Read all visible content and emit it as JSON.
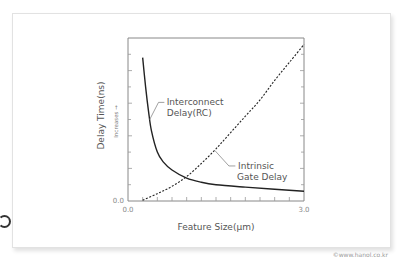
{
  "watermark": "©www.hanol.co.kr",
  "chart_data": {
    "type": "line",
    "title": "",
    "xlabel": "Feature Size(μm)",
    "ylabel": "Delay Time(ns)",
    "ylabel_secondary": "Increases →",
    "xlim": [
      0.0,
      3.0
    ],
    "ylim": [
      0,
      10
    ],
    "x_tick_labels": [
      "0.0",
      "3.0"
    ],
    "y_tick_labels": [
      "0.0"
    ],
    "x_minor_ticks": 12,
    "y_minor_ticks": 10,
    "grid": false,
    "legend": "none",
    "series": [
      {
        "name": "Interconnect Delay(RC)",
        "label_lines": [
          "Interconnect",
          "Delay(RC)"
        ],
        "style": "solid",
        "color": "#222222",
        "x": [
          0.25,
          0.3,
          0.35,
          0.4,
          0.5,
          0.6,
          0.75,
          1.0,
          1.25,
          1.5,
          2.0,
          2.5,
          3.0
        ],
        "y": [
          8.8,
          7.0,
          5.5,
          4.3,
          3.0,
          2.4,
          1.9,
          1.4,
          1.15,
          1.0,
          0.85,
          0.72,
          0.6
        ]
      },
      {
        "name": "Intrinsic Gate Delay",
        "label_lines": [
          "Intrinsic",
          "Gate Delay"
        ],
        "style": "dashed",
        "color": "#222222",
        "x": [
          0.25,
          0.5,
          0.75,
          1.0,
          1.25,
          1.5,
          1.75,
          2.0,
          2.25,
          2.5,
          2.75,
          3.0
        ],
        "y": [
          0.05,
          0.45,
          0.9,
          1.5,
          2.3,
          3.2,
          4.2,
          5.2,
          6.2,
          7.4,
          8.5,
          9.6
        ]
      }
    ]
  }
}
